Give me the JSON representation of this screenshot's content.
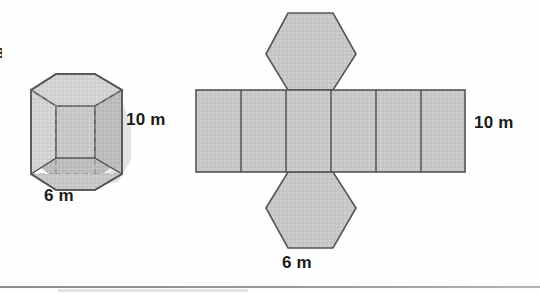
{
  "page": {
    "item_marker": "3",
    "background_color": "#fefefe",
    "rule_color": "#9a9a9a"
  },
  "style": {
    "face_fill": "#c8c8c8",
    "face_fill_light": "#d2d2d2",
    "face_fill_dark": "#b9b9b9",
    "stroke": "#555555",
    "dashed_stroke": "#8a8a8a",
    "shadow": "#cfcfcf"
  },
  "prism": {
    "name": "hexagonal-prism",
    "shape": "hexagonal prism",
    "perspective": "3d oblique with dashed hidden edges",
    "height_label": "10 m",
    "base_edge_label": "6 m"
  },
  "net": {
    "name": "hexagonal-prism-net",
    "shape": "net of hexagonal prism",
    "rectangle_count": 6,
    "hexagon_count": 2,
    "hexagon_positions": [
      "top",
      "bottom"
    ],
    "height_label": "10 m",
    "base_edge_label": "6 m"
  }
}
